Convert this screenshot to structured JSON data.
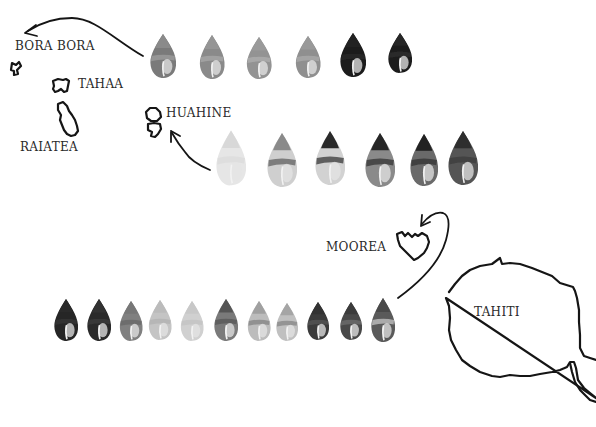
{
  "islands": {
    "bora_bora": {
      "label": "BORA BORA"
    },
    "tahaa": {
      "label": "TAHAA"
    },
    "raiatea": {
      "label": "RAIATEA"
    },
    "huahine": {
      "label": "HUAHINE"
    },
    "moorea": {
      "label": "MOOREA"
    },
    "tahiti": {
      "label": "TAHITI"
    }
  },
  "shell_rows": [
    {
      "name": "bora-bora-row",
      "arrow_to": "BORA BORA",
      "shells": [
        {
          "cx": 163,
          "cy": 56,
          "w": 26,
          "h": 44,
          "body": "#7a7a7a",
          "band": "#9a9a9a",
          "spire": "#8a8a8a"
        },
        {
          "cx": 212,
          "cy": 57,
          "w": 25,
          "h": 44,
          "body": "#8a8a8a",
          "band": "#a5a5a5",
          "spire": "#959595"
        },
        {
          "cx": 259,
          "cy": 58,
          "w": 25,
          "h": 42,
          "body": "#939393",
          "band": "#ababab",
          "spire": "#9a9a9a"
        },
        {
          "cx": 308,
          "cy": 57,
          "w": 25,
          "h": 42,
          "body": "#8f8f8f",
          "band": "#a8a8a8",
          "spire": "#999999"
        },
        {
          "cx": 353,
          "cy": 55,
          "w": 26,
          "h": 44,
          "body": "#1c1c1c",
          "band": "#2a2a2a",
          "spire": "#242424"
        },
        {
          "cx": 400,
          "cy": 53,
          "w": 24,
          "h": 40,
          "body": "#1f1f1f",
          "band": "#2e2e2e",
          "spire": "#262626"
        }
      ]
    },
    {
      "name": "huahine-row",
      "arrow_to": "HUAHINE",
      "shells": [
        {
          "cx": 231,
          "cy": 158,
          "w": 30,
          "h": 55,
          "body": "#e6e6e6",
          "band": "#dcdcdc",
          "spire": "#d8d8d8"
        },
        {
          "cx": 282,
          "cy": 160,
          "w": 30,
          "h": 54,
          "body": "#cfcfcf",
          "band": "#6e6e6e",
          "spire": "#8a8a8a"
        },
        {
          "cx": 330,
          "cy": 158,
          "w": 30,
          "h": 54,
          "body": "#d2d2d2",
          "band": "#4a4a4a",
          "spire": "#2a2a2a"
        },
        {
          "cx": 380,
          "cy": 160,
          "w": 30,
          "h": 54,
          "body": "#8a8a8a",
          "band": "#3c3c3c",
          "spire": "#262626"
        },
        {
          "cx": 424,
          "cy": 160,
          "w": 28,
          "h": 52,
          "body": "#6a6a6a",
          "band": "#3a3a3a",
          "spire": "#222222"
        },
        {
          "cx": 463,
          "cy": 158,
          "w": 30,
          "h": 54,
          "body": "#555555",
          "band": "#404040",
          "spire": "#2e2e2e"
        }
      ]
    },
    {
      "name": "tahiti-row",
      "arrow_to": "MOOREA",
      "shells": [
        {
          "cx": 66,
          "cy": 320,
          "w": 24,
          "h": 42,
          "body": "#262626",
          "band": "#333333",
          "spire": "#2a2a2a"
        },
        {
          "cx": 99,
          "cy": 320,
          "w": 24,
          "h": 42,
          "body": "#2a2a2a",
          "band": "#3a3a3a",
          "spire": "#303030"
        },
        {
          "cx": 131,
          "cy": 321,
          "w": 23,
          "h": 40,
          "body": "#808080",
          "band": "#6a6a6a",
          "spire": "#777777"
        },
        {
          "cx": 160,
          "cy": 320,
          "w": 23,
          "h": 40,
          "body": "#c4c4c4",
          "band": "#b4b4b4",
          "spire": "#bbbbbb"
        },
        {
          "cx": 192,
          "cy": 321,
          "w": 23,
          "h": 40,
          "body": "#d0d0d0",
          "band": "#c4c4c4",
          "spire": "#c8c8c8"
        },
        {
          "cx": 226,
          "cy": 320,
          "w": 24,
          "h": 42,
          "body": "#7a7a7a",
          "band": "#5a5a5a",
          "spire": "#555555"
        },
        {
          "cx": 259,
          "cy": 321,
          "w": 23,
          "h": 40,
          "body": "#bcbcbc",
          "band": "#8a8a8a",
          "spire": "#a0a0a0"
        },
        {
          "cx": 287,
          "cy": 322,
          "w": 22,
          "h": 38,
          "body": "#c0c0c0",
          "band": "#8c8c8c",
          "spire": "#a5a5a5"
        },
        {
          "cx": 318,
          "cy": 321,
          "w": 22,
          "h": 38,
          "body": "#3a3a3a",
          "band": "#555555",
          "spire": "#333333"
        },
        {
          "cx": 351,
          "cy": 321,
          "w": 22,
          "h": 38,
          "body": "#4a4a4a",
          "band": "#6a6a6a",
          "spire": "#3a3a3a"
        },
        {
          "cx": 383,
          "cy": 320,
          "w": 24,
          "h": 44,
          "body": "#5a5a5a",
          "band": "#b8b8b8",
          "spire": "#4a4a4a"
        }
      ]
    }
  ],
  "colors": {
    "ink": "#151515",
    "label": "#2a2a2a",
    "background": "#ffffff"
  }
}
